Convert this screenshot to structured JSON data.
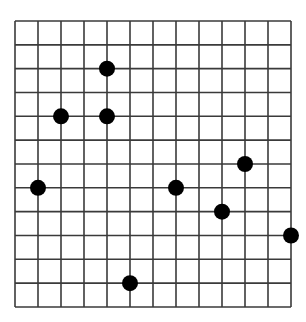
{
  "grid": {
    "columns": 12,
    "rows": 12,
    "origin_x": 15,
    "origin_y": 21,
    "cell_width": 23,
    "cell_height": 23.83,
    "line_color": "#3a3a3a",
    "line_width": 1.6,
    "background": "#ffffff"
  },
  "points": {
    "color": "#000000",
    "radius": 8,
    "items": [
      {
        "col": 4,
        "row": 2
      },
      {
        "col": 2,
        "row": 4
      },
      {
        "col": 4,
        "row": 4
      },
      {
        "col": 10,
        "row": 6
      },
      {
        "col": 1,
        "row": 7
      },
      {
        "col": 7,
        "row": 7
      },
      {
        "col": 9,
        "row": 8
      },
      {
        "col": 12,
        "row": 9
      },
      {
        "col": 5,
        "row": 11
      }
    ]
  }
}
